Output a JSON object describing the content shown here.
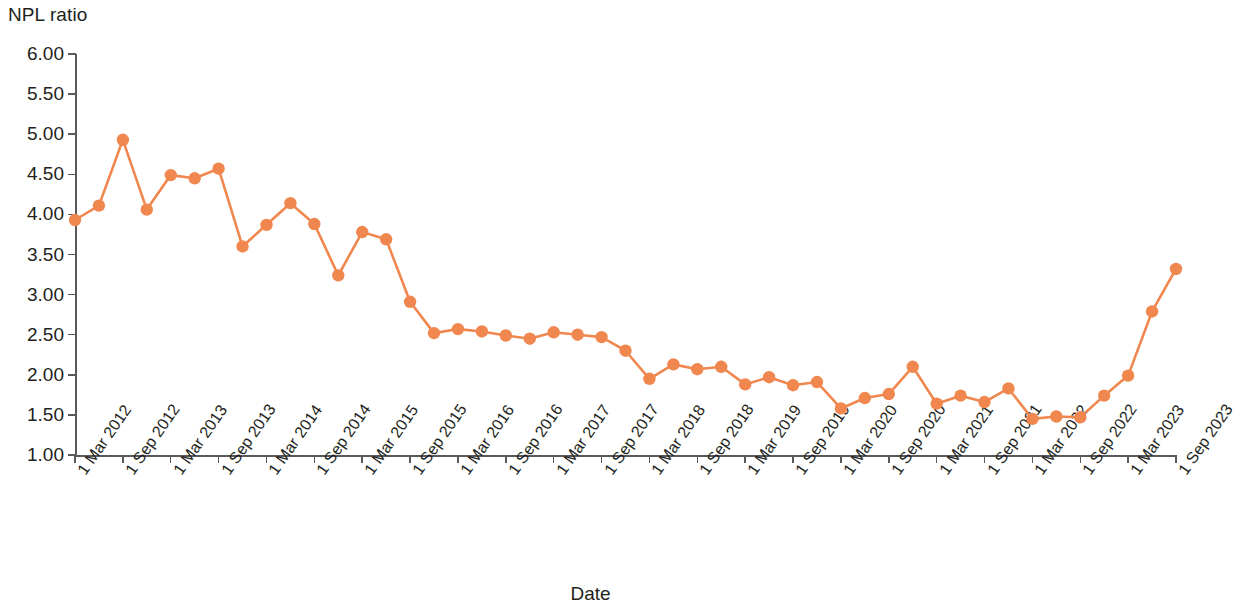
{
  "axes": {
    "y_title": "NPL ratio",
    "x_title": "Date",
    "y_ticks": [
      "1.00",
      "1.50",
      "2.00",
      "2.50",
      "3.00",
      "3.50",
      "4.00",
      "4.50",
      "5.00",
      "5.50",
      "6.00"
    ],
    "x_ticks": [
      "1 Mar 2012",
      "1 Sep 2012",
      "1 Mar 2013",
      "1 Sep 2013",
      "1 Mar 2014",
      "1 Sep 2014",
      "1 Mar 2015",
      "1 Sep 2015",
      "1 Mar 2016",
      "1 Sep 2016",
      "1 Mar 2017",
      "1 Sep 2017",
      "1 Mar 2018",
      "1 Sep 2018",
      "1 Mar 2019",
      "1 Sep 2019",
      "1 Mar 2020",
      "1 Sep 2020",
      "1 Mar 2021",
      "1 Sep 2021",
      "1 Mar 2022",
      "1 Sep 2022",
      "1 Mar 2023",
      "1 Sep 2023"
    ]
  },
  "colors": {
    "series": "#F0874F",
    "axis": "#58595b",
    "text": "#231f20"
  },
  "chart_data": {
    "type": "line",
    "title": "",
    "xlabel": "Date",
    "ylabel": "NPL ratio",
    "ylim": [
      1.0,
      6.0
    ],
    "ytick_step": 0.5,
    "grid": false,
    "legend": "none",
    "marker": "circle",
    "x": [
      "1 Mar 2012",
      "1 Jun 2012",
      "1 Sep 2012",
      "1 Dec 2012",
      "1 Mar 2013",
      "1 Jun 2013",
      "1 Sep 2013",
      "1 Dec 2013",
      "1 Mar 2014",
      "1 Jun 2014",
      "1 Sep 2014",
      "1 Dec 2014",
      "1 Mar 2015",
      "1 Jun 2015",
      "1 Sep 2015",
      "1 Dec 2015",
      "1 Mar 2016",
      "1 Jun 2016",
      "1 Sep 2016",
      "1 Dec 2016",
      "1 Mar 2017",
      "1 Jun 2017",
      "1 Sep 2017",
      "1 Dec 2017",
      "1 Mar 2018",
      "1 Jun 2018",
      "1 Sep 2018",
      "1 Dec 2018",
      "1 Mar 2019",
      "1 Jun 2019",
      "1 Sep 2019",
      "1 Dec 2019",
      "1 Mar 2020",
      "1 Jun 2020",
      "1 Sep 2020",
      "1 Dec 2020",
      "1 Mar 2021",
      "1 Jun 2021",
      "1 Sep 2021",
      "1 Dec 2021",
      "1 Mar 2022",
      "1 Jun 2022",
      "1 Sep 2022",
      "1 Dec 2022",
      "1 Mar 2023",
      "1 Jun 2023",
      "1 Sep 2023"
    ],
    "values": [
      3.93,
      4.11,
      4.93,
      4.06,
      4.49,
      4.45,
      4.57,
      3.6,
      3.87,
      4.14,
      3.88,
      3.24,
      3.78,
      3.69,
      2.91,
      2.52,
      2.57,
      2.54,
      2.49,
      2.45,
      2.53,
      2.5,
      2.47,
      2.3,
      1.95,
      2.13,
      2.07,
      2.1,
      1.88,
      1.97,
      1.87,
      1.91,
      1.58,
      1.71,
      1.76,
      2.1,
      1.64,
      1.74,
      1.66,
      1.83,
      1.45,
      1.48,
      1.47,
      1.74,
      1.99,
      2.79,
      3.32
    ],
    "series_color": "#F0874F",
    "series_name": "NPL ratio"
  }
}
